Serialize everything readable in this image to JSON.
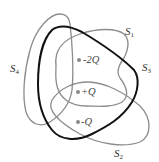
{
  "diagram": {
    "surfaces": [
      {
        "id": "S1",
        "name": "S",
        "sub": "1",
        "color": "#8c8c8c"
      },
      {
        "id": "S2",
        "name": "S",
        "sub": "2",
        "color": "#8c8c8c"
      },
      {
        "id": "S3",
        "name": "S",
        "sub": "3",
        "color": "#111111"
      },
      {
        "id": "S4",
        "name": "S",
        "sub": "4",
        "color": "#8c8c8c"
      }
    ],
    "charges": [
      {
        "label": "-2Q"
      },
      {
        "label": "+Q"
      },
      {
        "label": "-Q"
      }
    ]
  }
}
